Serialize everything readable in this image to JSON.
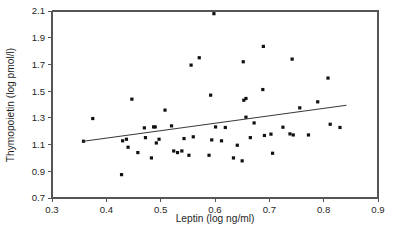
{
  "chart_data": {
    "type": "scatter",
    "title": "",
    "xlabel": "Leptin (log ng/ml)",
    "ylabel": "Thymopoietin (log pmol/l)",
    "xlim": [
      0.3,
      0.9
    ],
    "ylim": [
      0.7,
      2.1
    ],
    "xticks": [
      "0.3",
      "0.4",
      "0.5",
      "0.6",
      "0.7",
      "0.8",
      "0.9"
    ],
    "yticks": [
      "0.7",
      "0.9",
      "1.1",
      "1.3",
      "1.5",
      "1.7",
      "1.9",
      "2.1"
    ],
    "xtick_values": [
      0.3,
      0.4,
      0.5,
      0.6,
      0.7,
      0.8,
      0.9
    ],
    "ytick_values": [
      0.7,
      0.9,
      1.1,
      1.3,
      1.5,
      1.7,
      1.9,
      2.1
    ],
    "grid": false,
    "legend": false,
    "marker": "filled-square",
    "marker_color": "#111111",
    "trend_line": {
      "name": "regression-line",
      "color": "#3a3a3a",
      "x_start": 0.358,
      "y_start": 1.125,
      "x_end": 0.842,
      "y_end": 1.395
    },
    "points": [
      {
        "x": 0.358,
        "y": 1.125
      },
      {
        "x": 0.375,
        "y": 1.295
      },
      {
        "x": 0.428,
        "y": 0.875
      },
      {
        "x": 0.43,
        "y": 1.128
      },
      {
        "x": 0.437,
        "y": 1.14
      },
      {
        "x": 0.44,
        "y": 1.08
      },
      {
        "x": 0.447,
        "y": 1.44
      },
      {
        "x": 0.458,
        "y": 1.04
      },
      {
        "x": 0.47,
        "y": 1.225
      },
      {
        "x": 0.472,
        "y": 1.152
      },
      {
        "x": 0.483,
        "y": 1.0
      },
      {
        "x": 0.487,
        "y": 1.232
      },
      {
        "x": 0.49,
        "y": 1.232
      },
      {
        "x": 0.492,
        "y": 1.112
      },
      {
        "x": 0.497,
        "y": 1.14
      },
      {
        "x": 0.508,
        "y": 1.358
      },
      {
        "x": 0.52,
        "y": 1.24
      },
      {
        "x": 0.524,
        "y": 1.052
      },
      {
        "x": 0.531,
        "y": 1.04
      },
      {
        "x": 0.539,
        "y": 1.052
      },
      {
        "x": 0.543,
        "y": 1.145
      },
      {
        "x": 0.552,
        "y": 1.02
      },
      {
        "x": 0.556,
        "y": 1.695
      },
      {
        "x": 0.56,
        "y": 1.158
      },
      {
        "x": 0.571,
        "y": 1.75
      },
      {
        "x": 0.589,
        "y": 1.02
      },
      {
        "x": 0.592,
        "y": 1.47
      },
      {
        "x": 0.594,
        "y": 1.135
      },
      {
        "x": 0.598,
        "y": 2.08
      },
      {
        "x": 0.601,
        "y": 1.232
      },
      {
        "x": 0.612,
        "y": 1.128
      },
      {
        "x": 0.619,
        "y": 1.228
      },
      {
        "x": 0.634,
        "y": 1.0
      },
      {
        "x": 0.641,
        "y": 1.095
      },
      {
        "x": 0.65,
        "y": 0.978
      },
      {
        "x": 0.652,
        "y": 1.72
      },
      {
        "x": 0.653,
        "y": 1.432
      },
      {
        "x": 0.657,
        "y": 1.445
      },
      {
        "x": 0.657,
        "y": 1.305
      },
      {
        "x": 0.665,
        "y": 1.152
      },
      {
        "x": 0.672,
        "y": 1.262
      },
      {
        "x": 0.688,
        "y": 1.512
      },
      {
        "x": 0.689,
        "y": 1.835
      },
      {
        "x": 0.691,
        "y": 1.168
      },
      {
        "x": 0.703,
        "y": 1.178
      },
      {
        "x": 0.706,
        "y": 1.035
      },
      {
        "x": 0.725,
        "y": 1.23
      },
      {
        "x": 0.738,
        "y": 1.18
      },
      {
        "x": 0.742,
        "y": 1.74
      },
      {
        "x": 0.744,
        "y": 1.172
      },
      {
        "x": 0.756,
        "y": 1.375
      },
      {
        "x": 0.772,
        "y": 1.172
      },
      {
        "x": 0.789,
        "y": 1.42
      },
      {
        "x": 0.808,
        "y": 1.598
      },
      {
        "x": 0.812,
        "y": 1.252
      },
      {
        "x": 0.83,
        "y": 1.228
      }
    ]
  }
}
